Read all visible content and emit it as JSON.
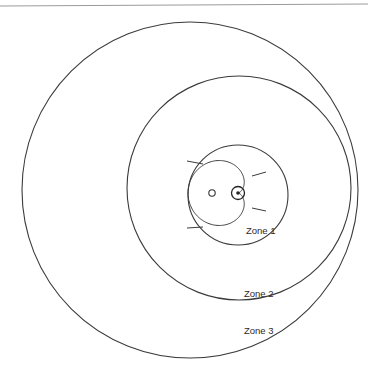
{
  "diagram": {
    "background_color": "#ffffff",
    "line_color": "#3b3b3b",
    "header_rule_color": "#9a9a9a",
    "labels": {
      "zone1": "Zone 1",
      "zone2": "Zone 2",
      "zone3": "Zone 3"
    },
    "markers": {
      "center_point_name": "center-point-marker",
      "satellite_point_name": "satellite-point-marker"
    }
  },
  "chart_data": {
    "type": "scatter",
    "xlabel": "",
    "ylabel": "",
    "grid": false,
    "legend": "none",
    "units": "pixels",
    "xlim": [
      0,
      368
    ],
    "ylim": [
      0,
      379
    ],
    "annotations": [
      {
        "text": "Zone 1",
        "x": 246,
        "y": 234
      },
      {
        "text": "Zone 2",
        "x": 244,
        "y": 297
      },
      {
        "text": "Zone 3",
        "x": 244,
        "y": 334
      }
    ],
    "series": [
      {
        "name": "Zone 3 boundary",
        "type": "circle",
        "cx": 190,
        "cy": 190,
        "r": 168,
        "stroke": "#3b3b3b"
      },
      {
        "name": "Zone 2 boundary",
        "type": "circle",
        "cx": 239,
        "cy": 188,
        "r": 112,
        "stroke": "#3b3b3b"
      },
      {
        "name": "Zone 1 boundary",
        "type": "circle",
        "cx": 238,
        "cy": 195,
        "r": 50,
        "stroke": "#3b3b3b"
      },
      {
        "name": "Cardioid pattern",
        "type": "cardioid",
        "cusp_x": 238,
        "cusp_y": 193,
        "scale": 25,
        "stroke": "#3b3b3b"
      },
      {
        "name": "Center point marker",
        "type": "point",
        "x": 238,
        "y": 193,
        "ring_r": 6.5,
        "dot_r": 1.8
      },
      {
        "name": "Satellite point marker",
        "type": "point",
        "x": 212,
        "y": 193,
        "ring_r": 3.2,
        "dot_r": 0
      }
    ],
    "ticks": [
      {
        "name": "upper-left-tick",
        "x1": 187,
        "y1": 161,
        "x2": 203,
        "y2": 164
      },
      {
        "name": "lower-left-tick",
        "x1": 187,
        "y1": 228,
        "x2": 203,
        "y2": 227
      },
      {
        "name": "upper-right-tick",
        "x1": 252,
        "y1": 176,
        "x2": 266,
        "y2": 172
      },
      {
        "name": "lower-right-tick",
        "x1": 252,
        "y1": 208,
        "x2": 266,
        "y2": 211
      }
    ]
  }
}
